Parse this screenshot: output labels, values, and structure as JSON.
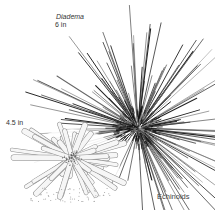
{
  "figure": {
    "caption": "Echinoids",
    "specimens": [
      {
        "name": "Diadema",
        "size_label": "6 in",
        "spine_style": "long thin dark spines",
        "center": [
          138,
          128
        ],
        "body_radius": 20,
        "spine_color": "#2a2a2a"
      },
      {
        "name": "",
        "size_label": "4.5 in",
        "spine_style": "thick pale pencil spines",
        "center": [
          72,
          158
        ],
        "body_radius": 10,
        "spine_color": "#9a9a9a"
      }
    ]
  },
  "labels": {
    "diadema_name": "Diadema",
    "diadema_size": "6 in",
    "pencil_size": "4.5 in",
    "caption": "Echinoids"
  },
  "colors": {
    "background": "#ffffff",
    "ink_dark": "#1e1e1e",
    "ink_light": "#a0a0a0",
    "spine_fill": "#f4f4f4"
  }
}
